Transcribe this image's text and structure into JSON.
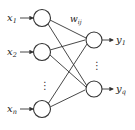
{
  "diagram": {
    "type": "neural-network",
    "inputs": [
      {
        "label": "x",
        "sub": "1"
      },
      {
        "label": "x",
        "sub": "2"
      },
      {
        "label": "x",
        "sub": "n"
      }
    ],
    "outputs": [
      {
        "label": "y",
        "sub": "1"
      },
      {
        "label": "y",
        "sub": "q"
      }
    ],
    "weight_label": {
      "label": "w",
      "sub": "ij"
    },
    "ellipsis": "⋮",
    "colors": {
      "stroke": "#333333",
      "background": "#ffffff"
    }
  }
}
